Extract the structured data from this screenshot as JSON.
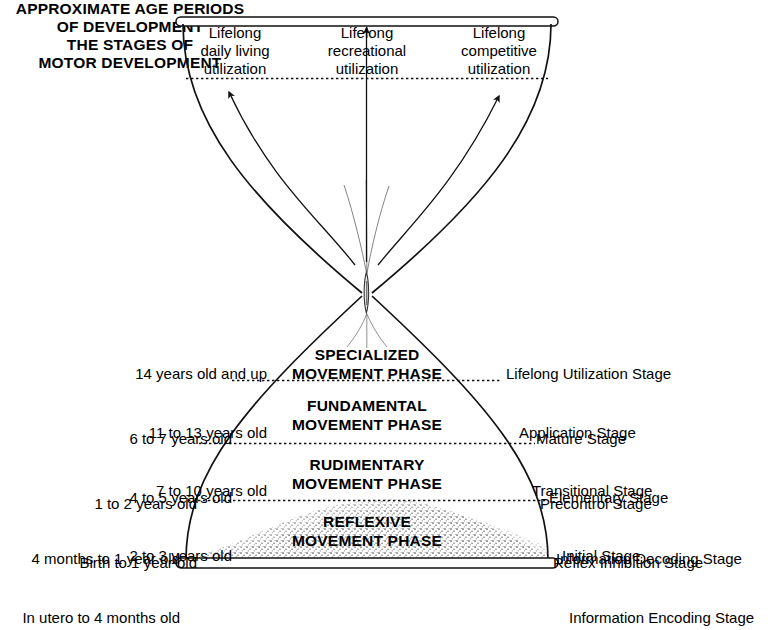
{
  "diagram": {
    "left_heading": "APPROXIMATE AGE PERIODS\nOF DEVELOPMENT",
    "right_heading": "THE STAGES OF\nMOTOR DEVELOPMENT",
    "utilization_labels": [
      "Lifelong\ndaily living\nutilization",
      "Lifelong\nrecreational\nutilization",
      "Lifelong\ncompetitive\nutilization"
    ],
    "phases": [
      {
        "name": "SPECIALIZED\nMOVEMENT PHASE",
        "ages": [
          "14 years old and up",
          "11 to 13 years old",
          "7 to 10 years old"
        ],
        "stages": [
          "Lifelong Utilization Stage",
          "Application Stage",
          "Transitional Stage"
        ]
      },
      {
        "name": "FUNDAMENTAL\nMOVEMENT PHASE",
        "ages": [
          "6 to 7 years old",
          "4 to 5 years old",
          "2 to 3 years old"
        ],
        "stages": [
          "Mature Stage",
          "Elementary Stage",
          "Initial Stage"
        ]
      },
      {
        "name": "RUDIMENTARY\nMOVEMENT PHASE",
        "ages": [
          "1 to 2 years old",
          "Birth to 1 year old"
        ],
        "stages": [
          "Precontrol Stage",
          "Reflex Inhibition Stage"
        ]
      },
      {
        "name": "REFLEXIVE\nMOVEMENT PHASE",
        "ages": [
          "4 months to 1 year old",
          "In utero to 4 months old"
        ],
        "stages": [
          "Information Decoding Stage",
          "Information Encoding Stage"
        ]
      }
    ],
    "colors": {
      "ink": "#111111",
      "sand": "#7a7a7a",
      "paper": "#ffffff"
    }
  }
}
